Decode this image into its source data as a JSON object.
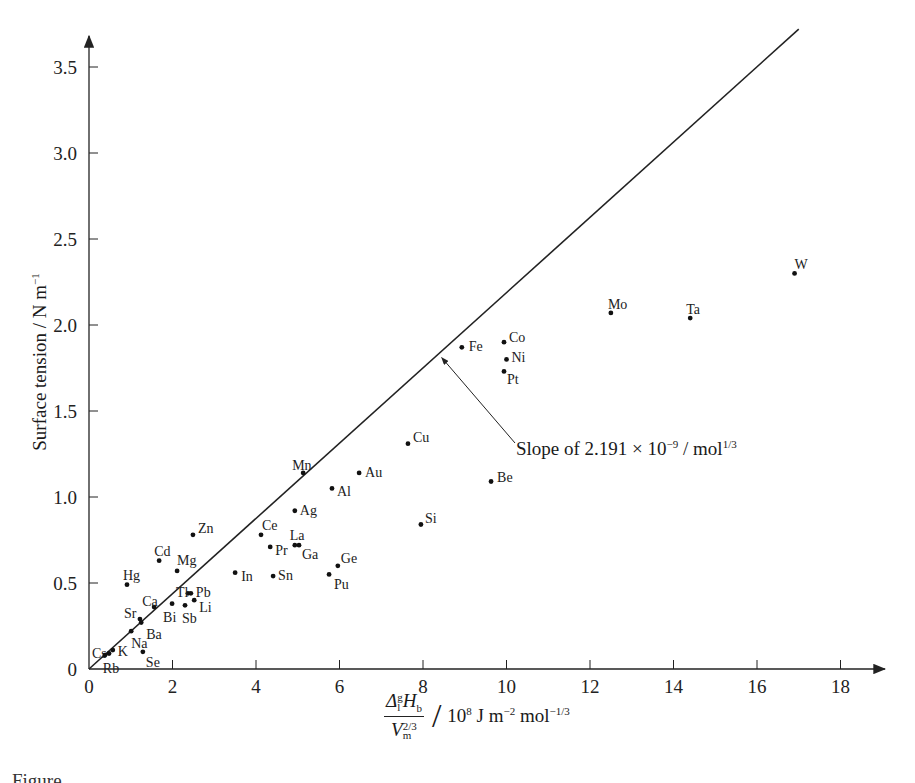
{
  "chart_data": {
    "type": "scatter",
    "title": "",
    "xlabel": {
      "numerator": "Δ",
      "numerator_sup": "g",
      "numerator_sub": "l",
      "numerator_rest": "H",
      "numerator_rest_sub": "b",
      "denominator": "V",
      "denominator_sub": "m",
      "denominator_sup": "2/3",
      "unit_prefix": "10",
      "unit_prefix_sup": "8",
      "unit_mid": " J m",
      "unit_mid_sup": "−2",
      "unit_end": " mol",
      "unit_end_sup": "−1/3"
    },
    "ylabel": {
      "text": "Surface tension / N m",
      "sup": "−1"
    },
    "xlim": [
      0,
      19
    ],
    "ylim": [
      0,
      3.7
    ],
    "x_ticks": [
      0,
      2,
      4,
      6,
      8,
      10,
      12,
      14,
      16,
      18
    ],
    "x_tick_labels": [
      "0",
      "2",
      "4",
      "6",
      "8",
      "10",
      "12",
      "14",
      "16",
      "18"
    ],
    "y_ticks": [
      0,
      0.5,
      1.0,
      1.5,
      2.0,
      2.5,
      3.0,
      3.5
    ],
    "y_tick_labels": [
      "0",
      "0.5",
      "1.0",
      "1.5",
      "2.0",
      "2.5",
      "3.0",
      "3.5"
    ],
    "grid": false,
    "legend": null,
    "series": [
      {
        "name": "metals",
        "points": [
          {
            "label": "W",
            "x": 16.9,
            "y": 2.3
          },
          {
            "label": "Mo",
            "x": 12.5,
            "y": 2.07
          },
          {
            "label": "Ta",
            "x": 14.4,
            "y": 2.04
          },
          {
            "label": "Co",
            "x": 9.94,
            "y": 1.9
          },
          {
            "label": "Fe",
            "x": 8.93,
            "y": 1.87
          },
          {
            "label": "Ni",
            "x": 10.0,
            "y": 1.8
          },
          {
            "label": "Pt",
            "x": 9.94,
            "y": 1.73
          },
          {
            "label": "Cu",
            "x": 7.64,
            "y": 1.31
          },
          {
            "label": "Mn",
            "x": 5.13,
            "y": 1.14
          },
          {
            "label": "Au",
            "x": 6.47,
            "y": 1.14
          },
          {
            "label": "Be",
            "x": 9.63,
            "y": 1.09
          },
          {
            "label": "Al",
            "x": 5.82,
            "y": 1.05
          },
          {
            "label": "Ag",
            "x": 4.93,
            "y": 0.92
          },
          {
            "label": "Si",
            "x": 7.95,
            "y": 0.84
          },
          {
            "label": "Zn",
            "x": 2.49,
            "y": 0.78
          },
          {
            "label": "Ce",
            "x": 4.12,
            "y": 0.78
          },
          {
            "label": "La",
            "x": 4.93,
            "y": 0.72
          },
          {
            "label": "Ga",
            "x": 5.03,
            "y": 0.72
          },
          {
            "label": "Pr",
            "x": 4.34,
            "y": 0.71
          },
          {
            "label": "Cd",
            "x": 1.68,
            "y": 0.63
          },
          {
            "label": "Ge",
            "x": 5.96,
            "y": 0.6
          },
          {
            "label": "Mg",
            "x": 2.11,
            "y": 0.57
          },
          {
            "label": "In",
            "x": 3.5,
            "y": 0.56
          },
          {
            "label": "Pu",
            "x": 5.75,
            "y": 0.55
          },
          {
            "label": "Sn",
            "x": 4.41,
            "y": 0.54
          },
          {
            "label": "Hg",
            "x": 0.91,
            "y": 0.49
          },
          {
            "label": "Tl",
            "x": 2.37,
            "y": 0.44
          },
          {
            "label": "Pb",
            "x": 2.44,
            "y": 0.44
          },
          {
            "label": "Li",
            "x": 2.52,
            "y": 0.4
          },
          {
            "label": "Bi",
            "x": 1.99,
            "y": 0.38
          },
          {
            "label": "Sb",
            "x": 2.3,
            "y": 0.37
          },
          {
            "label": "Ca",
            "x": 1.56,
            "y": 0.36
          },
          {
            "label": "Sr",
            "x": 1.22,
            "y": 0.29
          },
          {
            "label": "Ba",
            "x": 1.25,
            "y": 0.27
          },
          {
            "label": "Na",
            "x": 1.01,
            "y": 0.22
          },
          {
            "label": "K",
            "x": 0.57,
            "y": 0.11
          },
          {
            "label": "Se",
            "x": 1.29,
            "y": 0.1
          },
          {
            "label": "Cs",
            "x": 0.48,
            "y": 0.09
          },
          {
            "label": "Rb",
            "x": 0.38,
            "y": 0.08
          }
        ]
      }
    ],
    "fit_line": {
      "x0": 0,
      "y0": 0,
      "x1": 17.0,
      "y1": 3.72,
      "slope": 0.2191
    },
    "annotations": [
      {
        "text_prefix": "Slope of 2.191 × 10",
        "text_sup1": "−9",
        "text_mid": " / mol",
        "text_sup2": "1/3",
        "arrow_to": {
          "x": 8.45,
          "y": 1.81
        }
      }
    ]
  },
  "caption": {
    "text": "Figure"
  }
}
